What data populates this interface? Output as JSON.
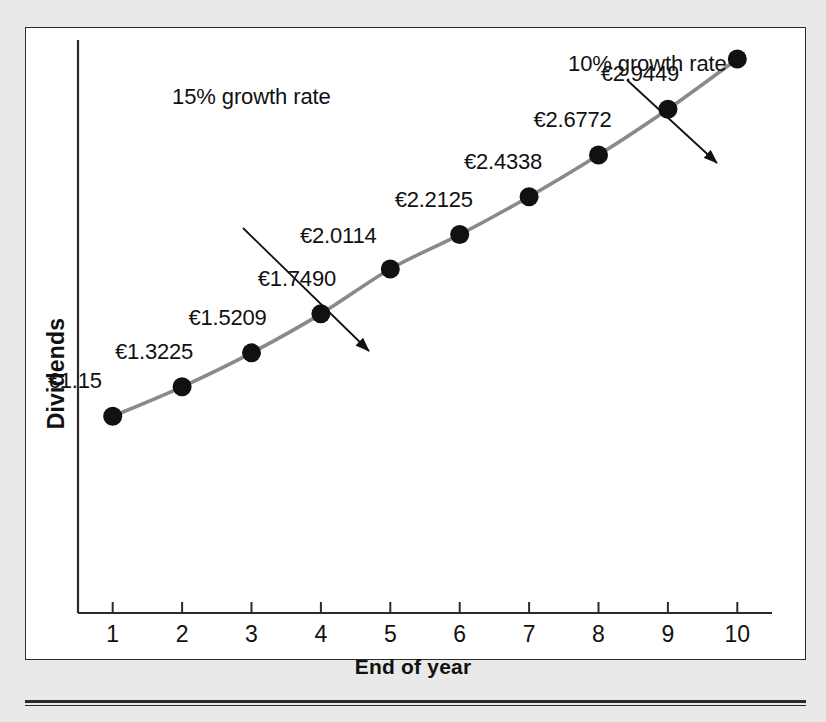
{
  "chart_data": {
    "type": "line",
    "title": "",
    "xlabel": "End of year",
    "ylabel": "Dividends",
    "categories": [
      1,
      2,
      3,
      4,
      5,
      6,
      7,
      8,
      9,
      10
    ],
    "x_tick_labels": [
      "1",
      "2",
      "3",
      "4",
      "5",
      "6",
      "7",
      "8",
      "9",
      "10"
    ],
    "y_tick_labels": [],
    "xlim": [
      0.5,
      10.5
    ],
    "ylim": [
      0.0,
      3.35
    ],
    "grid": false,
    "legend": null,
    "currency_symbol": "€",
    "series": [
      {
        "name": "Dividends",
        "values": [
          1.15,
          1.3225,
          1.5209,
          1.749,
          2.0114,
          2.2125,
          2.4338,
          2.6772,
          2.9449,
          3.2394
        ],
        "point_labels": [
          "€1.15",
          "€1.3225",
          "€1.5209",
          "€1.7490",
          "€2.0114",
          "€2.2125",
          "€2.4338",
          "€2.6772",
          "€2.9449",
          ""
        ],
        "line_color": "#8a8a8a",
        "marker_color": "#111111"
      }
    ],
    "annotations": [
      {
        "text": "15% growth rate",
        "target_year": 4,
        "target_value": 1.749
      },
      {
        "text": "10% growth rate",
        "target_year": 9.45,
        "target_value": 3.05
      }
    ],
    "colors": {
      "line": "#8a8a8a",
      "marker": "#111111",
      "axis": "#2b2b2b",
      "text": "#111111",
      "plot_background": "#ffffff",
      "page_background": "#e9e9e9"
    }
  },
  "figure": {
    "frame_border_color": "#2b2b2b",
    "bottom_rule_color": "#2b2b2b"
  }
}
